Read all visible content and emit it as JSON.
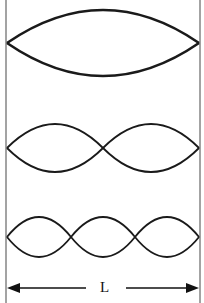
{
  "diagram": {
    "type": "standing-waves",
    "length_label": "L",
    "modes": [
      {
        "harmonic": 1,
        "loops": 1
      },
      {
        "harmonic": 2,
        "loops": 2
      },
      {
        "harmonic": 3,
        "loops": 3
      }
    ],
    "colors": {
      "stroke": "#1a1a1a",
      "wall": "#555555",
      "background": "#ffffff"
    }
  }
}
